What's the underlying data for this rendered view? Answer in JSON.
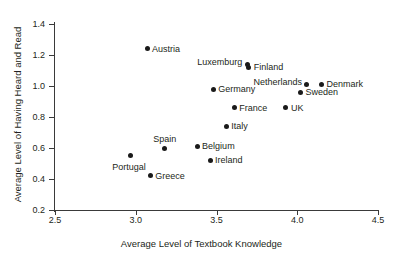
{
  "chart_data": {
    "type": "scatter",
    "title": "",
    "xlabel": "Average Level of Textbook Knowledge",
    "ylabel": "Average Level of Having Heard and Read",
    "xlim": [
      2.5,
      4.5
    ],
    "ylim": [
      0.2,
      1.4
    ],
    "xticks": [
      "2.5",
      "3.0",
      "3.5",
      "4.0",
      "4.5"
    ],
    "xtick_values": [
      2.5,
      3.0,
      3.5,
      4.0,
      4.5
    ],
    "yticks": [
      "0.2",
      "0.4",
      "0.6",
      "0.8",
      "1.0",
      "1.2",
      "1.4"
    ],
    "ytick_values": [
      0.2,
      0.4,
      0.6,
      0.8,
      1.0,
      1.2,
      1.4
    ],
    "grid": false,
    "legend": "none",
    "marker": "filled-circle",
    "marker_color": "#1a1a1a",
    "points": [
      {
        "label": "Austria",
        "x": 3.07,
        "y": 1.24,
        "label_pos": "right"
      },
      {
        "label": "Luxemburg",
        "x": 3.69,
        "y": 1.14,
        "label_pos": "left"
      },
      {
        "label": "Finland",
        "x": 3.7,
        "y": 1.12,
        "label_pos": "right"
      },
      {
        "label": "Netherlands",
        "x": 4.06,
        "y": 1.01,
        "label_pos": "left"
      },
      {
        "label": "Denmark",
        "x": 4.15,
        "y": 1.01,
        "label_pos": "right"
      },
      {
        "label": "Germany",
        "x": 3.48,
        "y": 0.98,
        "label_pos": "right"
      },
      {
        "label": "Sweden",
        "x": 4.02,
        "y": 0.96,
        "label_pos": "right"
      },
      {
        "label": "France",
        "x": 3.61,
        "y": 0.86,
        "label_pos": "right"
      },
      {
        "label": "UK",
        "x": 3.93,
        "y": 0.86,
        "label_pos": "right"
      },
      {
        "label": "Italy",
        "x": 3.56,
        "y": 0.74,
        "label_pos": "right"
      },
      {
        "label": "Belgium",
        "x": 3.38,
        "y": 0.61,
        "label_pos": "right"
      },
      {
        "label": "Spain",
        "x": 3.18,
        "y": 0.6,
        "label_pos": "above"
      },
      {
        "label": "Portugal",
        "x": 2.97,
        "y": 0.55,
        "label_pos": "below"
      },
      {
        "label": "Ireland",
        "x": 3.46,
        "y": 0.52,
        "label_pos": "right"
      },
      {
        "label": "Greece",
        "x": 3.09,
        "y": 0.42,
        "label_pos": "right"
      }
    ]
  }
}
